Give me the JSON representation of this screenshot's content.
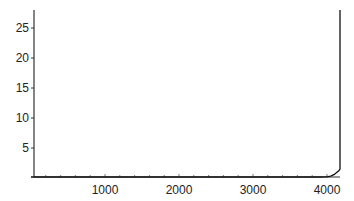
{
  "chart_data": {
    "type": "line",
    "title": "",
    "xlabel": "",
    "ylabel": "",
    "xlim": [
      0,
      4180
    ],
    "ylim": [
      0,
      28
    ],
    "grid": false,
    "x_ticks": [
      1000,
      2000,
      3000,
      4000
    ],
    "x_tick_labels": [
      "1000",
      "2000",
      "3000",
      "4000"
    ],
    "y_ticks": [
      5,
      10,
      15,
      20,
      25
    ],
    "y_tick_labels": [
      "5",
      "10",
      "15",
      "20",
      "25"
    ],
    "x_minor_tick_step": 200,
    "series": [
      {
        "name": "series",
        "x": [
          0,
          1000,
          2000,
          3000,
          3900,
          4000,
          4050,
          4100,
          4130,
          4160,
          4180,
          4180
        ],
        "y": [
          0,
          0,
          0,
          0,
          0.05,
          0.2,
          0.3,
          0.6,
          0.9,
          1.2,
          1.5,
          28
        ]
      }
    ]
  }
}
